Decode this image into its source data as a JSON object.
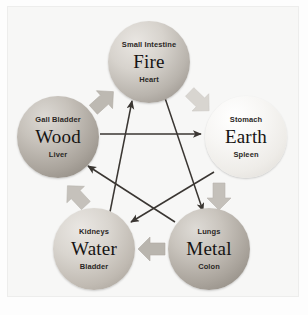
{
  "diagram": {
    "background_color": "#f7f7f6",
    "block_arrow_color": "#b6b2ab",
    "line_arrow_color": "#3a3632"
  },
  "elements": [
    {
      "id": "fire",
      "element": "Fire",
      "top_organ": "Small Intestine",
      "bottom_organ": "Heart",
      "color": "#b9b4ad"
    },
    {
      "id": "earth",
      "element": "Earth",
      "top_organ": "Stomach",
      "bottom_organ": "Spleen",
      "color": "#eeece8"
    },
    {
      "id": "metal",
      "element": "Metal",
      "top_organ": "Lungs",
      "bottom_organ": "Colon",
      "color": "#aaa49c"
    },
    {
      "id": "water",
      "element": "Water",
      "top_organ": "Kidneys",
      "bottom_organ": "Bladder",
      "color": "#c0bab2"
    },
    {
      "id": "wood",
      "element": "Wood",
      "top_organ": "Gall Bladder",
      "bottom_organ": "Liver",
      "color": "#a9a39b"
    }
  ],
  "generating_cycle": [
    {
      "from": "Wood",
      "to": "Fire"
    },
    {
      "from": "Fire",
      "to": "Earth"
    },
    {
      "from": "Earth",
      "to": "Metal"
    },
    {
      "from": "Metal",
      "to": "Water"
    },
    {
      "from": "Water",
      "to": "Wood"
    }
  ],
  "controlling_cycle": [
    {
      "from": "Wood",
      "to": "Earth"
    },
    {
      "from": "Earth",
      "to": "Water"
    },
    {
      "from": "Water",
      "to": "Fire"
    },
    {
      "from": "Fire",
      "to": "Metal"
    },
    {
      "from": "Metal",
      "to": "Wood"
    }
  ]
}
